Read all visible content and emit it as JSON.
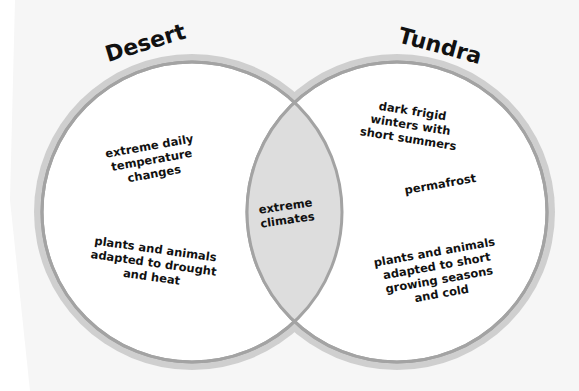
{
  "diagram": {
    "type": "venn",
    "colors": {
      "background": "#f6f6f6",
      "circle_fill": "#ffffff",
      "ring_outer": "#cfcfcf",
      "ring_inner": "#a3a3a3",
      "intersection_fill": "#dddddd",
      "text": "#111111"
    },
    "left": {
      "title": "Desert",
      "facts": [
        [
          "extreme daily",
          "temperature",
          "changes"
        ],
        [
          "plants and animals",
          "adapted to drought",
          "and heat"
        ]
      ]
    },
    "right": {
      "title": "Tundra",
      "facts": [
        [
          "dark frigid",
          "winters with",
          "short summers"
        ],
        [
          "permafrost"
        ],
        [
          "plants and animals",
          "adapted to short",
          "growing seasons",
          "and cold"
        ]
      ]
    },
    "overlap": {
      "facts": [
        [
          "extreme",
          "climates"
        ]
      ]
    }
  }
}
